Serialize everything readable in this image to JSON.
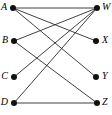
{
  "figure": {
    "name": "bipartite-graph",
    "width": 112,
    "height": 115,
    "background_color": "#ffffff",
    "edge_color": "#2b2b2b",
    "vertex_color": "#111111",
    "label_color": "#000000"
  },
  "graph_data": {
    "type": "diagram",
    "diagram_kind": "bipartite-graph",
    "left_set": [
      "A",
      "B",
      "C",
      "D"
    ],
    "right_set": [
      "W",
      "X",
      "Y",
      "Z"
    ],
    "nodes": [
      {
        "id": "A",
        "label": "A",
        "x": 13,
        "y": 8,
        "side": "left",
        "label_x": 7,
        "label_y": 8
      },
      {
        "id": "B",
        "label": "B",
        "x": 14,
        "y": 41,
        "side": "left",
        "label_x": 8,
        "label_y": 41
      },
      {
        "id": "C",
        "label": "C",
        "x": 14,
        "y": 77,
        "side": "left",
        "label_x": 8,
        "label_y": 77
      },
      {
        "id": "D",
        "label": "D",
        "x": 14,
        "y": 103,
        "side": "left",
        "label_x": 8,
        "label_y": 103
      },
      {
        "id": "W",
        "label": "W",
        "x": 97,
        "y": 8,
        "side": "right",
        "label_x": 102,
        "label_y": 8
      },
      {
        "id": "X",
        "label": "X",
        "x": 96,
        "y": 41,
        "side": "right",
        "label_x": 102,
        "label_y": 41
      },
      {
        "id": "Y",
        "label": "Y",
        "x": 96,
        "y": 77,
        "side": "right",
        "label_x": 102,
        "label_y": 77
      },
      {
        "id": "Z",
        "label": "Z",
        "x": 97,
        "y": 103,
        "side": "right",
        "label_x": 102,
        "label_y": 103
      }
    ],
    "edges": [
      {
        "from": "A",
        "to": "W"
      },
      {
        "from": "A",
        "to": "X"
      },
      {
        "from": "A",
        "to": "Y"
      },
      {
        "from": "B",
        "to": "W"
      },
      {
        "from": "B",
        "to": "Z"
      },
      {
        "from": "C",
        "to": "W"
      },
      {
        "from": "D",
        "to": "W"
      },
      {
        "from": "D",
        "to": "Z"
      }
    ],
    "node_radius": 3,
    "edge_count": 8,
    "node_count": 8
  }
}
